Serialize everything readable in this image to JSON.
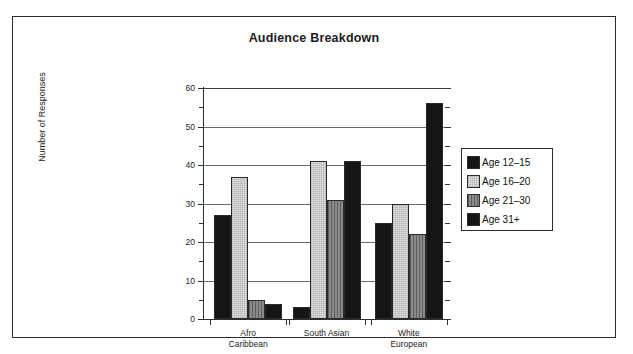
{
  "chart_data": {
    "type": "bar",
    "title": "Audience Breakdown",
    "xlabel": "",
    "ylabel": "Number of Responses",
    "ylim": [
      0,
      60
    ],
    "ytick_step": 10,
    "yminor_step": 5,
    "ytick_labels": [
      "0",
      "10",
      "20",
      "30",
      "40",
      "50",
      "60"
    ],
    "grid": true,
    "grid_axis": "y",
    "legend_position": "right",
    "categories": [
      "Afro Caribbean",
      "South Asian",
      "White European"
    ],
    "category_lines": [
      [
        "Afro",
        "Caribbean"
      ],
      [
        "South Asian",
        ""
      ],
      [
        "White",
        "European"
      ]
    ],
    "series": [
      {
        "name": "Age 12–15",
        "values": [
          27,
          3,
          25
        ],
        "fill": "solid-black",
        "color": "#151515"
      },
      {
        "name": "Age 16–20",
        "values": [
          37,
          41,
          30
        ],
        "fill": "light-dotted",
        "color": "#e3e3e3"
      },
      {
        "name": "Age 21–30",
        "values": [
          5,
          31,
          22
        ],
        "fill": "gray-vertical-hatch",
        "color": "#8a8a8a"
      },
      {
        "name": "Age 31+",
        "values": [
          4,
          41,
          56
        ],
        "fill": "solid-black",
        "color": "#151515"
      }
    ]
  },
  "legend": {
    "entries": [
      {
        "label": "Age 12–15"
      },
      {
        "label": "Age 16–20"
      },
      {
        "label": "Age 21–30"
      },
      {
        "label": "Age 31+"
      }
    ]
  }
}
